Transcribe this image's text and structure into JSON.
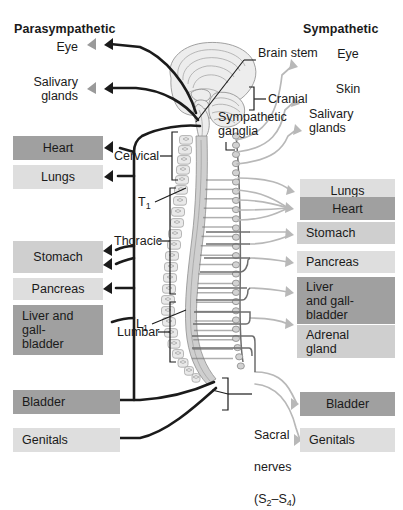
{
  "diagram": {
    "title_left": "Parasympathetic",
    "title_right": "Sympathetic"
  },
  "left_targets": [
    {
      "label": "Eye",
      "style": "plain"
    },
    {
      "label": "Salivary\nglands",
      "style": "plain"
    },
    {
      "label": "Heart",
      "style": "dark"
    },
    {
      "label": "Lungs",
      "style": "light"
    },
    {
      "label": "Stomach",
      "style": "mid"
    },
    {
      "label": "Pancreas",
      "style": "light"
    },
    {
      "label": "Liver and\ngall-\nbladder",
      "style": "dark"
    },
    {
      "label": "Bladder",
      "style": "dark"
    },
    {
      "label": "Genitals",
      "style": "light"
    }
  ],
  "right_targets": [
    {
      "label": "Eye",
      "style": "plain"
    },
    {
      "label": "Skin",
      "style": "plain"
    },
    {
      "label": "Salivary\nglands",
      "style": "plain"
    },
    {
      "label": "Lungs",
      "style": "light"
    },
    {
      "label": "Heart",
      "style": "dark"
    },
    {
      "label": "Stomach",
      "style": "mid"
    },
    {
      "label": "Pancreas",
      "style": "light"
    },
    {
      "label": "Liver\nand gall-\nbladder",
      "style": "dark"
    },
    {
      "label": "Adrenal\ngland",
      "style": "mid"
    },
    {
      "label": "Bladder",
      "style": "dark"
    },
    {
      "label": "Genitals",
      "style": "light"
    }
  ],
  "anatomy_labels": {
    "brain_stem": "Brain stem",
    "cranial": "Cranial",
    "sympathetic_ganglia": "Sympathetic\nganglia",
    "cervical": "Cervical",
    "thoracic": "Thoracic",
    "lumbar": "Lumbar",
    "t1": "T",
    "t1_sub": "1",
    "l1": "L",
    "l1_sub": "1",
    "sacral_line1": "Sacral",
    "sacral_line2": "nerves",
    "sacral_line3_a": "(S",
    "sacral_line3_b": "2",
    "sacral_line3_c": "–S",
    "sacral_line3_d": "4",
    "sacral_line3_e": ")"
  },
  "colors": {
    "para_nerve": "#1b1b1b",
    "symp_nerve": "#b8b8b8",
    "symp_pre": "#6e6e6e",
    "chip_dark": "#a0a0a0",
    "chip_mid": "#cfcfcf",
    "chip_light": "#dedede",
    "cord": "#cfcfcf",
    "vertebra": "#e9e9e9",
    "background": "#ffffff"
  }
}
